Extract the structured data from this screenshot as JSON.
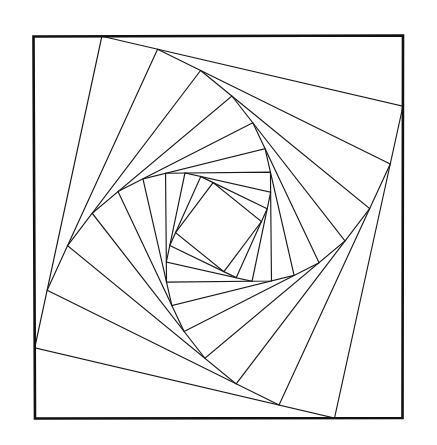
{
  "document": {
    "title": "Nested Rotating Squares Spiral",
    "kind": "line-drawing",
    "background_color": "#ffffff",
    "canvas": {
      "width": 437,
      "height": 445
    }
  },
  "figure": {
    "name": "square-spiral",
    "outer_border": {
      "stroke_color": "#111111",
      "stroke_width": 2.6,
      "points": [
        [
          33.5,
          36.5
        ],
        [
          403.0,
          35.5
        ],
        [
          402.5,
          418.0
        ],
        [
          35.0,
          418.5
        ]
      ]
    },
    "spiral": {
      "stroke_color": "#1a1a1a",
      "stroke_width": 1.15,
      "fill": "none",
      "iterations": 10,
      "edge_fraction": 0.185,
      "direction": "clockwise",
      "seed_points": [
        [
          33.5,
          36.5
        ],
        [
          403.0,
          35.5
        ],
        [
          402.5,
          418.0
        ],
        [
          35.0,
          418.5
        ]
      ]
    },
    "measured_vertices": {
      "note": "sampled node positions read off the screenshot, in canvas pixels",
      "ring_0": [
        [
          33.5,
          36.5
        ],
        [
          403.0,
          35.5
        ],
        [
          402.5,
          418.0
        ],
        [
          35.0,
          418.5
        ]
      ],
      "ring_1": [
        [
          102.0,
          51.0
        ],
        [
          392.0,
          106.5
        ],
        [
          335.0,
          403.0
        ],
        [
          36.0,
          345.0
        ]
      ],
      "ring_2": [
        [
          159.5,
          77.5
        ],
        [
          365.5,
          162.0
        ],
        [
          277.5,
          378.0
        ],
        [
          51.0,
          283.5
        ]
      ],
      "ring_3": [
        [
          197.5,
          100.0
        ],
        [
          339.0,
          207.5
        ],
        [
          238.0,
          352.0
        ],
        [
          78.0,
          229.5
        ]
      ],
      "ring_4": [
        [
          219.0,
          123.5
        ],
        [
          308.0,
          235.0
        ],
        [
          211.5,
          320.0
        ],
        [
          110.0,
          198.0
        ]
      ],
      "ring_5": [
        [
          222.5,
          144.5
        ],
        [
          282.0,
          250.0
        ],
        [
          193.0,
          288.0
        ],
        [
          136.0,
          176.5
        ]
      ]
    }
  }
}
